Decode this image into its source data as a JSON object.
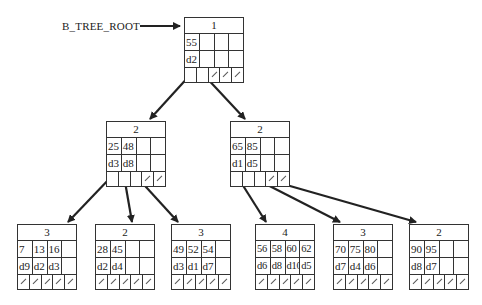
{
  "root_label": "B_TREE_ROOT",
  "colors": {
    "line": "#222222",
    "border": "#333333",
    "background": "#ffffff"
  },
  "nodes": {
    "root": {
      "count": "1",
      "keys": [
        "55",
        "",
        "",
        ""
      ],
      "data": [
        "d2",
        "",
        "",
        ""
      ],
      "pointers": [
        "ptr",
        "ptr",
        "null",
        "null",
        "null"
      ]
    },
    "mid_left": {
      "count": "2",
      "keys": [
        "25",
        "48",
        "",
        ""
      ],
      "data": [
        "d3",
        "d8",
        "",
        ""
      ],
      "pointers": [
        "ptr",
        "ptr",
        "ptr",
        "null",
        "null"
      ]
    },
    "mid_right": {
      "count": "2",
      "keys": [
        "65",
        "85",
        "",
        ""
      ],
      "data": [
        "d1",
        "d5",
        "",
        ""
      ],
      "pointers": [
        "ptr",
        "ptr",
        "ptr",
        "null",
        "null"
      ]
    },
    "leaf1": {
      "count": "3",
      "keys": [
        "7",
        "13",
        "16",
        ""
      ],
      "data": [
        "d9",
        "d2",
        "d3",
        ""
      ],
      "pointers": [
        "null",
        "null",
        "null",
        "null",
        "null"
      ]
    },
    "leaf2": {
      "count": "2",
      "keys": [
        "28",
        "45",
        "",
        ""
      ],
      "data": [
        "d2",
        "d4",
        "",
        ""
      ],
      "pointers": [
        "null",
        "null",
        "null",
        "null",
        "null"
      ]
    },
    "leaf3": {
      "count": "3",
      "keys": [
        "49",
        "52",
        "54",
        ""
      ],
      "data": [
        "d3",
        "d1",
        "d7",
        ""
      ],
      "pointers": [
        "null",
        "null",
        "null",
        "null",
        "null"
      ]
    },
    "leaf4": {
      "count": "4",
      "keys": [
        "56",
        "58",
        "60",
        "62"
      ],
      "data": [
        "d6",
        "d8",
        "d10",
        "d5"
      ],
      "pointers": [
        "null",
        "null",
        "null",
        "null",
        "null"
      ]
    },
    "leaf5": {
      "count": "3",
      "keys": [
        "70",
        "75",
        "80",
        ""
      ],
      "data": [
        "d7",
        "d4",
        "d6",
        ""
      ],
      "pointers": [
        "null",
        "null",
        "null",
        "null",
        "null"
      ]
    },
    "leaf6": {
      "count": "2",
      "keys": [
        "90",
        "95",
        "",
        ""
      ],
      "data": [
        "d8",
        "d7",
        "",
        ""
      ],
      "pointers": [
        "null",
        "null",
        "null",
        "null",
        "null"
      ]
    }
  }
}
